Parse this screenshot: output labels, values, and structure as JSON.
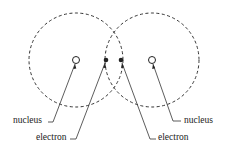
{
  "diagram": {
    "type": "covalent-bond-overlap",
    "atoms": [
      {
        "id": "left",
        "nucleus": {
          "cx": 76,
          "cy": 60,
          "r": 3.5
        },
        "shell": {
          "cx": 76,
          "cy": 60,
          "r": 47
        }
      },
      {
        "id": "right",
        "nucleus": {
          "cx": 152,
          "cy": 60,
          "r": 3.5
        },
        "shell": {
          "cx": 152,
          "cy": 60,
          "r": 47
        }
      }
    ],
    "electrons": [
      {
        "cx": 106,
        "cy": 60,
        "r": 2.3
      },
      {
        "cx": 121,
        "cy": 60,
        "r": 2.3
      }
    ],
    "labels": [
      {
        "id": "nucleus-left",
        "text": "nucleus"
      },
      {
        "id": "electron-left",
        "text": "electron"
      },
      {
        "id": "electron-right",
        "text": "electron"
      },
      {
        "id": "nucleus-right",
        "text": "nucleus"
      }
    ],
    "colors": {
      "line": "#333333",
      "text": "#222222",
      "background": "#ffffff"
    }
  }
}
